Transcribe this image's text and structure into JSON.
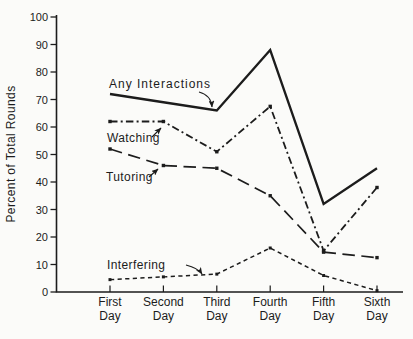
{
  "figure": {
    "background": "#fbfbf9",
    "ink_color": "#1c1c1c"
  },
  "chart_data": {
    "type": "line",
    "title": "",
    "xlabel": "",
    "ylabel": "Percent of Total Rounds",
    "categories": [
      "First Day",
      "Second Day",
      "Third Day",
      "Fourth Day",
      "Fifth Day",
      "Sixth Day"
    ],
    "categories_two_line": [
      [
        "First",
        "Day"
      ],
      [
        "Second",
        "Day"
      ],
      [
        "Third",
        "Day"
      ],
      [
        "Fourth",
        "Day"
      ],
      [
        "Fifth",
        "Day"
      ],
      [
        "Sixth",
        "Day"
      ]
    ],
    "ylim": [
      0,
      100
    ],
    "yticks": [
      0,
      10,
      20,
      30,
      40,
      50,
      60,
      70,
      80,
      90,
      100
    ],
    "grid": false,
    "legend_position": "inline-annotations",
    "series": [
      {
        "name": "Any Interactions",
        "line_style": "solid",
        "marker": "none",
        "values": [
          72,
          69,
          66,
          88,
          32,
          45
        ]
      },
      {
        "name": "Watching",
        "line_style": "dash-dot",
        "marker": "square",
        "values": [
          62,
          62,
          51,
          67.5,
          15,
          38
        ]
      },
      {
        "name": "Tutoring",
        "line_style": "long-dash",
        "marker": "square",
        "values": [
          52,
          46,
          45,
          35,
          14.5,
          12.5
        ]
      },
      {
        "name": "Interfering",
        "line_style": "short-dash",
        "marker": "square",
        "values": [
          4.5,
          5.5,
          6.5,
          16,
          6,
          0.5
        ]
      }
    ],
    "annotations": [
      {
        "series_index": 0,
        "text_x": 109,
        "text_y": 88,
        "letter_spacing": 1.0,
        "arrow": [
          [
            199,
            92
          ],
          [
            211,
            95
          ],
          [
            212,
            107
          ]
        ]
      },
      {
        "series_index": 1,
        "text_x": 107,
        "text_y": 142,
        "letter_spacing": 0.4,
        "arrow": [
          [
            152,
            137
          ],
          [
            161,
            128
          ]
        ]
      },
      {
        "series_index": 2,
        "text_x": 106,
        "text_y": 181,
        "letter_spacing": 0.4,
        "arrow": [
          [
            149,
            177
          ],
          [
            158,
            169
          ]
        ]
      },
      {
        "series_index": 3,
        "text_x": 107,
        "text_y": 269,
        "letter_spacing": 0.4,
        "arrow": [
          [
            186,
            265
          ],
          [
            198,
            268
          ],
          [
            202,
            274
          ]
        ]
      }
    ]
  }
}
